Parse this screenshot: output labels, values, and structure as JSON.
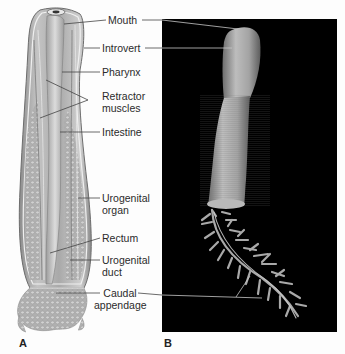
{
  "figure": {
    "panels": [
      {
        "id": "A",
        "letter": "A",
        "type": "illustration",
        "subject": "internal anatomy of worm (longitudinal section)"
      },
      {
        "id": "B",
        "letter": "B",
        "type": "photograph",
        "subject": "whole specimen on black background"
      }
    ],
    "labels": {
      "mouth": "Mouth",
      "introvert": "Introvert",
      "pharynx": "Pharynx",
      "retractor_1": "Retractor",
      "retractor_2": "muscles",
      "intestine": "Intestine",
      "urogenital_organ_1": "Urogenital",
      "urogenital_organ_2": "organ",
      "rectum": "Rectum",
      "urogenital_duct_1": "Urogenital",
      "urogenital_duct_2": "duct",
      "caudal_1": "Caudal",
      "caudal_2": "appendage"
    },
    "colors": {
      "background": "#fdfdfd",
      "photo_background": "#000000",
      "leader_line": "#444444",
      "leader_line_on_photo": "#bdbdbd",
      "illustration_gray": "#9a9a9a",
      "specimen_gray": "#a8a8a8"
    }
  }
}
